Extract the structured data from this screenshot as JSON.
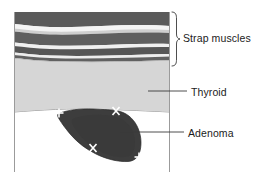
{
  "figure": {
    "kind": "thyroid-ultrasound-schematic",
    "caption_labels": {
      "strap_muscles": "Strap muscles",
      "thyroid": "Thyroid",
      "adenoma": "Adenoma"
    },
    "colors": {
      "background": "#ffffff",
      "muscle_dark": "#555555",
      "muscle_mid": "#6e6e6e",
      "fascia_light": "#f2f2f2",
      "thyroid": "#d5d5d5",
      "adenoma": "#3d3d3d",
      "outline": "#8d8d8d",
      "leader_line": "#3a3a3a",
      "caliper": "#ffffff",
      "text": "#1b1b1b"
    },
    "image_frame": {
      "left": 14,
      "right": 170,
      "top": 12,
      "bottom": 172
    },
    "regions": [
      {
        "name": "strap-muscles",
        "label": "Strap muscles",
        "band_count": 5,
        "y_top": 12,
        "y_bottom": 62
      },
      {
        "name": "thyroid",
        "label": "Thyroid",
        "y_top": 62,
        "y_bottom": 146
      },
      {
        "name": "adenoma",
        "label": "Adenoma",
        "y_top": 108,
        "y_bottom": 165
      }
    ],
    "calipers": [
      {
        "name": "caliper-plus-upper-left",
        "glyph": "+",
        "x": 59,
        "y": 113
      },
      {
        "name": "caliper-x-upper-right",
        "glyph": "x",
        "x": 116,
        "y": 111
      },
      {
        "name": "caliper-x-lower-left",
        "glyph": "x",
        "x": 93,
        "y": 148
      },
      {
        "name": "caliper-plus-lower-right",
        "glyph": "+",
        "x": 139,
        "y": 157
      }
    ],
    "annotations": {
      "strap_muscles_brace": {
        "x": 174,
        "y_top": 12,
        "y_bottom": 66
      },
      "thyroid_leader": {
        "x_start": 148,
        "x_end": 186,
        "y": 91
      },
      "adenoma_leader": {
        "x_start": 120,
        "x_end": 183,
        "y": 132
      }
    }
  }
}
